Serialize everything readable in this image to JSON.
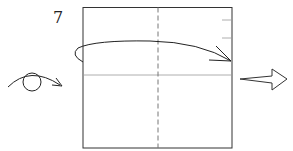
{
  "diagram": {
    "step_number": "7",
    "type": "origami-fold-instruction",
    "elements": [
      "square-paper",
      "vertical-dashed-valley-fold",
      "horizontal-crease",
      "fold-arrow",
      "turn-over-eye-symbol",
      "next-step-arrow"
    ],
    "colors": {
      "line": "#333333",
      "crease": "#999999",
      "background": "#ffffff"
    }
  }
}
